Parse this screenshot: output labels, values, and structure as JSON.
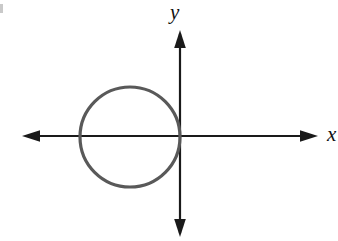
{
  "figure": {
    "title": "",
    "background_color": "#ffffff",
    "corner_mark": ""
  },
  "axes": {
    "x_label": "x",
    "y_label": "y",
    "axis_color": "#1a1a1a",
    "axis_stroke_width": 2.2,
    "origin": {
      "x": 180,
      "y": 136
    },
    "x_axis": {
      "start_x": 22,
      "end_x": 318,
      "y": 136,
      "arrow_left": true,
      "arrow_right": true
    },
    "y_axis": {
      "x": 180,
      "start_y": 30,
      "end_y": 237,
      "arrow_up": true,
      "arrow_down": true
    }
  },
  "chart_data": {
    "type": "scatter",
    "title": "",
    "xlabel": "x",
    "ylabel": "y",
    "grid": false,
    "legend": false,
    "shapes": [
      {
        "kind": "circle",
        "center_px": [
          130,
          137
        ],
        "radius_px": 50,
        "stroke_color": "#595959",
        "stroke_width": 3.2,
        "fill": "none",
        "tangent_to": "y-axis",
        "tangent_point_px": [
          180,
          137
        ],
        "description": "circle tangent to the y-axis at the origin, lying in the second and third quadrants"
      }
    ],
    "annotations": []
  }
}
